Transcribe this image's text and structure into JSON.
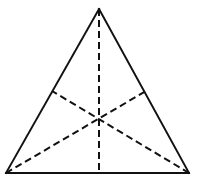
{
  "figure": {
    "title": "Equilateral triangle with three medians drawn",
    "background_color": "#ffffff",
    "stroke_color": "#111111",
    "canvas": {
      "width": 197,
      "height": 190
    }
  },
  "chart_data": {
    "type": "diagram",
    "xlabel": "",
    "ylabel": "",
    "xlim": [
      0,
      197
    ],
    "ylim": [
      0,
      190
    ],
    "grid": false,
    "legend": null,
    "shapes": [
      {
        "name": "triangle",
        "kind": "polygon",
        "style": "solid",
        "stroke": "#111111",
        "stroke_width": 2,
        "fill": "none",
        "points": [
          {
            "label": "apex",
            "x": 99,
            "y": 9
          },
          {
            "label": "bottom-right",
            "x": 189,
            "y": 173
          },
          {
            "label": "bottom-left",
            "x": 6,
            "y": 173
          }
        ]
      },
      {
        "name": "median-apex-to-base",
        "kind": "line",
        "style": "dashed",
        "stroke": "#111111",
        "stroke_width": 2,
        "dash": [
          7,
          4
        ],
        "from": {
          "label": "apex",
          "x": 99,
          "y": 9
        },
        "to": {
          "label": "base-midpoint",
          "x": 99,
          "y": 173
        }
      },
      {
        "name": "median-bottom-left-to-right-side",
        "kind": "line",
        "style": "dashed",
        "stroke": "#111111",
        "stroke_width": 2,
        "dash": [
          7,
          4
        ],
        "from": {
          "label": "bottom-left",
          "x": 6,
          "y": 173
        },
        "to": {
          "label": "right-side-midpoint",
          "x": 146,
          "y": 91
        }
      },
      {
        "name": "median-bottom-right-to-left-side",
        "kind": "line",
        "style": "dashed",
        "stroke": "#111111",
        "stroke_width": 2,
        "dash": [
          7,
          4
        ],
        "from": {
          "label": "bottom-right",
          "x": 189,
          "y": 173
        },
        "to": {
          "label": "left-side-midpoint",
          "x": 52,
          "y": 91
        }
      }
    ],
    "points": [
      {
        "label": "apex",
        "x": 99,
        "y": 9,
        "marker": "vertex"
      },
      {
        "label": "bottom-left",
        "x": 6,
        "y": 173,
        "marker": "vertex"
      },
      {
        "label": "bottom-right",
        "x": 189,
        "y": 173,
        "marker": "vertex"
      },
      {
        "label": "left-side-midpoint",
        "x": 52,
        "y": 91,
        "marker": "midpoint"
      },
      {
        "label": "right-side-midpoint",
        "x": 146,
        "y": 91,
        "marker": "midpoint"
      },
      {
        "label": "base-midpoint",
        "x": 99,
        "y": 173,
        "marker": "midpoint"
      },
      {
        "label": "centroid",
        "x": 99,
        "y": 118,
        "marker": "intersection"
      }
    ],
    "annotations": []
  }
}
